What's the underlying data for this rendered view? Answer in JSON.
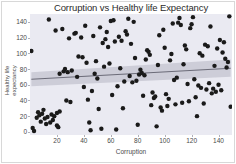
{
  "chart_data": {
    "type": "scatter",
    "title": "Corruption vs Healthy life Expectancy",
    "xlabel": "Corruption",
    "ylabel": "Healthy life expectancy",
    "xlim": [
      0,
      150
    ],
    "ylim": [
      -4,
      150
    ],
    "xticks": [
      20,
      40,
      60,
      80,
      100,
      120,
      140
    ],
    "yticks": [
      0,
      20,
      40,
      60,
      80,
      100,
      120,
      140
    ],
    "grid": false,
    "legend": "none",
    "point_color": "#1a1a1a",
    "point_size": 4.4,
    "plot_background": "#eaeaf2",
    "figure_background": "#ffffff",
    "regression": {
      "type": "linear-fit",
      "line_color": "#6b6b78",
      "band_color": "#c3c3cf",
      "x_start": 1,
      "y_start": 67,
      "x_end": 149,
      "y_end": 81,
      "band_halfwidth_start": 9,
      "band_halfwidth_end": 11
    },
    "series": [
      {
        "name": "countries",
        "points": [
          [
            1,
            102
          ],
          [
            2,
            7
          ],
          [
            3,
            3
          ],
          [
            4,
            19
          ],
          [
            5,
            22
          ],
          [
            6,
            21
          ],
          [
            7,
            18
          ],
          [
            8,
            15
          ],
          [
            9,
            25
          ],
          [
            10,
            17
          ],
          [
            11,
            12
          ],
          [
            12,
            20
          ],
          [
            13,
            23
          ],
          [
            14,
            14
          ],
          [
            15,
            27
          ],
          [
            16,
            16
          ],
          [
            17,
            11
          ],
          [
            18,
            143
          ],
          [
            19,
            24
          ],
          [
            20,
            8
          ],
          [
            21,
            26
          ],
          [
            22,
            6
          ],
          [
            23,
            80
          ],
          [
            24,
            79
          ],
          [
            25,
            132
          ],
          [
            26,
            128
          ],
          [
            27,
            81
          ],
          [
            28,
            39
          ],
          [
            29,
            96
          ],
          [
            30,
            95
          ],
          [
            31,
            35
          ],
          [
            33,
            78
          ],
          [
            34,
            137
          ],
          [
            35,
            77
          ],
          [
            36,
            120
          ],
          [
            37,
            118
          ],
          [
            38,
            30
          ],
          [
            39,
            124
          ],
          [
            40,
            94
          ],
          [
            41,
            74
          ],
          [
            42,
            59
          ],
          [
            43,
            135
          ],
          [
            44,
            41
          ],
          [
            45,
            13
          ],
          [
            46,
            53
          ],
          [
            47,
            1
          ],
          [
            48,
            83
          ],
          [
            49,
            89
          ],
          [
            50,
            2
          ],
          [
            51,
            131
          ],
          [
            52,
            5
          ],
          [
            53,
            69
          ],
          [
            54,
            28
          ],
          [
            55,
            88
          ],
          [
            56,
            125
          ],
          [
            57,
            113
          ],
          [
            58,
            117
          ],
          [
            59,
            86
          ],
          [
            60,
            107
          ],
          [
            61,
            148
          ],
          [
            62,
            45
          ],
          [
            63,
            146
          ],
          [
            64,
            130
          ],
          [
            65,
            4
          ],
          [
            66,
            56
          ],
          [
            67,
            121
          ],
          [
            68,
            82
          ],
          [
            69,
            119
          ],
          [
            70,
            31
          ],
          [
            71,
            63
          ],
          [
            72,
            127
          ],
          [
            73,
            126
          ],
          [
            74,
            144
          ],
          [
            75,
            70
          ],
          [
            76,
            115
          ],
          [
            77,
            61
          ],
          [
            78,
            142
          ],
          [
            79,
            92
          ],
          [
            80,
            66
          ],
          [
            81,
            10
          ],
          [
            82,
            72
          ],
          [
            83,
            76
          ],
          [
            84,
            75
          ],
          [
            85,
            48
          ],
          [
            86,
            73
          ],
          [
            87,
            91
          ],
          [
            88,
            101
          ],
          [
            89,
            103
          ],
          [
            90,
            99
          ],
          [
            91,
            33
          ],
          [
            92,
            51
          ],
          [
            93,
            44
          ],
          [
            94,
            43
          ],
          [
            95,
            9
          ],
          [
            96,
            84
          ],
          [
            97,
            123
          ],
          [
            98,
            32
          ],
          [
            99,
            29
          ],
          [
            100,
            129
          ],
          [
            101,
            106
          ],
          [
            102,
            46
          ],
          [
            103,
            34
          ],
          [
            104,
            42
          ],
          [
            105,
            93
          ],
          [
            106,
            97
          ],
          [
            107,
            139
          ],
          [
            108,
            122
          ],
          [
            109,
            36
          ],
          [
            110,
            67
          ],
          [
            111,
            140
          ],
          [
            112,
            145
          ],
          [
            113,
            141
          ],
          [
            114,
            37
          ],
          [
            115,
            87
          ],
          [
            116,
            111
          ],
          [
            117,
            104
          ],
          [
            118,
            62
          ],
          [
            119,
            40
          ],
          [
            120,
            133
          ],
          [
            121,
            136
          ],
          [
            122,
            147
          ],
          [
            123,
            65
          ],
          [
            124,
            47
          ],
          [
            125,
            21
          ],
          [
            126,
            57
          ],
          [
            127,
            100
          ],
          [
            128,
            58
          ],
          [
            129,
            98
          ],
          [
            130,
            38
          ],
          [
            131,
            112
          ],
          [
            132,
            54
          ],
          [
            133,
            108
          ],
          [
            134,
            64
          ],
          [
            135,
            138
          ],
          [
            136,
            49
          ],
          [
            137,
            55
          ],
          [
            138,
            85
          ],
          [
            139,
            50
          ],
          [
            140,
            105
          ],
          [
            141,
            68
          ],
          [
            142,
            134
          ],
          [
            143,
            110
          ],
          [
            144,
            71
          ],
          [
            145,
            60
          ],
          [
            146,
            116
          ],
          [
            147,
            52
          ],
          [
            148,
            109
          ],
          [
            149,
            114
          ]
        ]
      }
    ],
    "scatter_points": [
      [
        1,
        103
      ],
      [
        2,
        5
      ],
      [
        3,
        1
      ],
      [
        5,
        18
      ],
      [
        6,
        25
      ],
      [
        7,
        21
      ],
      [
        8,
        13
      ],
      [
        9,
        23
      ],
      [
        10,
        28
      ],
      [
        11,
        17
      ],
      [
        12,
        10
      ],
      [
        13,
        19
      ],
      [
        14,
        143
      ],
      [
        15,
        12
      ],
      [
        16,
        22
      ],
      [
        17,
        15
      ],
      [
        18,
        20
      ],
      [
        19,
        129
      ],
      [
        20,
        24
      ],
      [
        20,
        8
      ],
      [
        21,
        6
      ],
      [
        22,
        26
      ],
      [
        22,
        74
      ],
      [
        24,
        131
      ],
      [
        25,
        77
      ],
      [
        26,
        80
      ],
      [
        27,
        40
      ],
      [
        28,
        76
      ],
      [
        29,
        119
      ],
      [
        30,
        38
      ],
      [
        31,
        78
      ],
      [
        33,
        125
      ],
      [
        34,
        126
      ],
      [
        35,
        70
      ],
      [
        36,
        96
      ],
      [
        38,
        120
      ],
      [
        39,
        95
      ],
      [
        40,
        57
      ],
      [
        41,
        135
      ],
      [
        42,
        88
      ],
      [
        43,
        41
      ],
      [
        44,
        12
      ],
      [
        45,
        2
      ],
      [
        46,
        52
      ],
      [
        47,
        122
      ],
      [
        48,
        74
      ],
      [
        49,
        90
      ],
      [
        50,
        68
      ],
      [
        51,
        29
      ],
      [
        52,
        133
      ],
      [
        53,
        4
      ],
      [
        54,
        113
      ],
      [
        55,
        83
      ],
      [
        56,
        118
      ],
      [
        57,
        127
      ],
      [
        58,
        108
      ],
      [
        59,
        87
      ],
      [
        60,
        141
      ],
      [
        61,
        47
      ],
      [
        62,
        142
      ],
      [
        63,
        115
      ],
      [
        64,
        3
      ],
      [
        65,
        58
      ],
      [
        66,
        121
      ],
      [
        67,
        81
      ],
      [
        68,
        116
      ],
      [
        69,
        30
      ],
      [
        70,
        64
      ],
      [
        71,
        128
      ],
      [
        72,
        124
      ],
      [
        73,
        144
      ],
      [
        74,
        71
      ],
      [
        75,
        112
      ],
      [
        76,
        63
      ],
      [
        77,
        140
      ],
      [
        78,
        94
      ],
      [
        79,
        65
      ],
      [
        80,
        9
      ],
      [
        81,
        73
      ],
      [
        82,
        79
      ],
      [
        83,
        75
      ],
      [
        84,
        46
      ],
      [
        85,
        72
      ],
      [
        86,
        92
      ],
      [
        87,
        104
      ],
      [
        88,
        102
      ],
      [
        89,
        98
      ],
      [
        90,
        34
      ],
      [
        91,
        50
      ],
      [
        92,
        43
      ],
      [
        93,
        45
      ],
      [
        94,
        7
      ],
      [
        95,
        85
      ],
      [
        96,
        123
      ],
      [
        97,
        31
      ],
      [
        98,
        27
      ],
      [
        99,
        130
      ],
      [
        100,
        107
      ],
      [
        101,
        48
      ],
      [
        102,
        33
      ],
      [
        103,
        42
      ],
      [
        104,
        91
      ],
      [
        105,
        99
      ],
      [
        106,
        138
      ],
      [
        107,
        66
      ],
      [
        108,
        35
      ],
      [
        109,
        69
      ],
      [
        110,
        139
      ],
      [
        111,
        145
      ],
      [
        112,
        136
      ],
      [
        113,
        37
      ],
      [
        114,
        86
      ],
      [
        115,
        110
      ],
      [
        116,
        105
      ],
      [
        117,
        61
      ],
      [
        118,
        39
      ],
      [
        119,
        132
      ],
      [
        120,
        137
      ],
      [
        121,
        146
      ],
      [
        122,
        67
      ],
      [
        123,
        44
      ],
      [
        124,
        20
      ],
      [
        125,
        59
      ],
      [
        126,
        100
      ],
      [
        127,
        56
      ],
      [
        128,
        97
      ],
      [
        129,
        36
      ],
      [
        130,
        111
      ],
      [
        131,
        54
      ],
      [
        132,
        109
      ],
      [
        133,
        62
      ],
      [
        134,
        134
      ],
      [
        135,
        49
      ],
      [
        136,
        55
      ],
      [
        137,
        84
      ],
      [
        138,
        51
      ],
      [
        139,
        106
      ],
      [
        140,
        60
      ],
      [
        141,
        117
      ],
      [
        142,
        53
      ],
      [
        143,
        101
      ],
      [
        144,
        114
      ],
      [
        145,
        93
      ],
      [
        146,
        82
      ],
      [
        147,
        89
      ],
      [
        148,
        147
      ],
      [
        149,
        32
      ]
    ]
  },
  "axis": {
    "x_tick_labels": [
      "20",
      "40",
      "60",
      "80",
      "100",
      "120",
      "140"
    ],
    "y_tick_labels": [
      "0",
      "20",
      "40",
      "60",
      "80",
      "100",
      "120",
      "140"
    ]
  }
}
